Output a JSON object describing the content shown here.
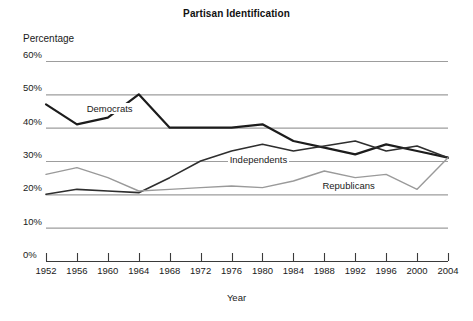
{
  "chart_data": {
    "type": "line",
    "title": "Partisan Identification",
    "xlabel": "Year",
    "ylabel": "Percentage",
    "x": [
      1952,
      1956,
      1960,
      1964,
      1968,
      1972,
      1976,
      1980,
      1984,
      1988,
      1992,
      1996,
      2000,
      2004
    ],
    "categories": [
      "1952",
      "1956",
      "1960",
      "1964",
      "1968",
      "1972",
      "1976",
      "1980",
      "1984",
      "1988",
      "1992",
      "1996",
      "2000",
      "2004"
    ],
    "xlim": [
      1952,
      2004
    ],
    "ylim": [
      0,
      60
    ],
    "ytick_labels": [
      "0%",
      "10%",
      "20%",
      "30%",
      "40%",
      "50%",
      "60%"
    ],
    "ytick_values": [
      0,
      10,
      20,
      30,
      40,
      50,
      60
    ],
    "grid": "horizontal",
    "legend": "inline-annotations",
    "series": [
      {
        "name": "Democrats",
        "color": "#1c1c1c",
        "width": 2.2,
        "values": [
          47,
          41,
          43,
          50,
          40,
          40,
          40,
          41,
          36,
          34,
          32,
          35,
          33,
          31
        ],
        "label_x": 1957,
        "label_y": 45.5
      },
      {
        "name": "Independents",
        "color": "#2e2e2e",
        "width": 1.6,
        "values": [
          20,
          21.5,
          21,
          20.5,
          25,
          30,
          33,
          35,
          33,
          34.5,
          36,
          33,
          34.5,
          31
        ],
        "label_x": 1975.5,
        "label_y": 30.2
      },
      {
        "name": "Republicans",
        "color": "#9a9a9a",
        "width": 1.4,
        "values": [
          26,
          28,
          25,
          21,
          21.5,
          22,
          22.5,
          22,
          24,
          27,
          25,
          26,
          21.5,
          31
        ],
        "label_x": 1987.5,
        "label_y": 22.5
      }
    ]
  },
  "axes": {
    "gridline_color": "#9d9d9d",
    "baseline_color": "#3a3a3a",
    "tick_color": "#3a3a3a"
  }
}
